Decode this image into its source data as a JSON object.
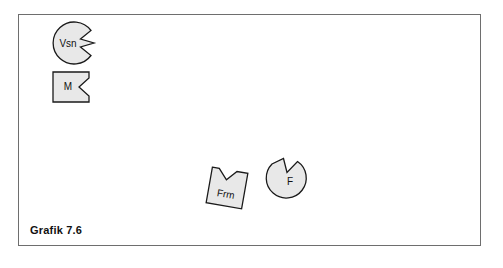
{
  "figure": {
    "caption": "Grafik 7.6",
    "frame_color": "#6e6e6e",
    "background_color": "#ffffff"
  },
  "style": {
    "shape_fill": "#e8e8e8",
    "shape_stroke": "#1a1a1a",
    "label_color": "#111111"
  },
  "shapes": [
    {
      "id": "vsn",
      "label": "Vsn",
      "form": "circle-with-notch",
      "notch_side": "right",
      "cx": 74,
      "cy": 43,
      "r": 21,
      "label_x": 68,
      "label_y": 44
    },
    {
      "id": "m",
      "label": "M",
      "form": "square-with-notch",
      "notch_side": "right",
      "x": 53,
      "y": 72,
      "w": 36,
      "h": 30,
      "label_x": 68,
      "label_y": 87
    },
    {
      "id": "frm",
      "label": "Frm",
      "form": "square-with-notch",
      "notch_side": "top",
      "x": 209,
      "y": 170,
      "w": 36,
      "h": 36,
      "rotation": 10,
      "label_x": 227,
      "label_y": 195
    },
    {
      "id": "f",
      "label": "F",
      "form": "circle-with-notch",
      "notch_side": "top",
      "cx": 286,
      "cy": 178,
      "r": 20,
      "label_x": 290,
      "label_y": 182
    }
  ]
}
